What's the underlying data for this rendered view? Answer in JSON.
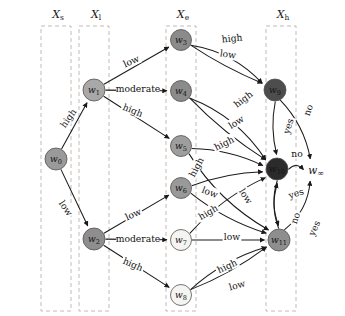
{
  "figure": {
    "width": 345,
    "height": 316,
    "background": "#ffffff",
    "type": "layered-directed-graph"
  },
  "groups": [
    {
      "id": "Xs",
      "label": "X",
      "subscript": "s",
      "label_x": 58,
      "label_y": 14,
      "box_x": 41,
      "box_y": 26,
      "box_w": 30,
      "box_h": 285
    },
    {
      "id": "Xl",
      "label": "X",
      "subscript": "l",
      "label_x": 96,
      "label_y": 14,
      "box_x": 79,
      "box_y": 26,
      "box_w": 30,
      "box_h": 285
    },
    {
      "id": "Xe",
      "label": "X",
      "subscript": "e",
      "label_x": 183,
      "label_y": 14,
      "box_x": 166,
      "box_y": 26,
      "box_w": 30,
      "box_h": 285
    },
    {
      "id": "Xh",
      "label": "X",
      "subscript": "h",
      "label_x": 283,
      "label_y": 14,
      "box_x": 266,
      "box_y": 26,
      "box_w": 30,
      "box_h": 285
    }
  ],
  "nodes": [
    {
      "id": "w0",
      "label": "w",
      "subscript": "0",
      "x": 56,
      "y": 159,
      "r": 11,
      "fill": "#9a9a9a",
      "text_tone": "on-dark"
    },
    {
      "id": "w1",
      "label": "w",
      "subscript": "1",
      "x": 94,
      "y": 90,
      "r": 11,
      "fill": "#a8a8a8",
      "text_tone": "on-dark"
    },
    {
      "id": "w2",
      "label": "w",
      "subscript": "2",
      "x": 94,
      "y": 239,
      "r": 11,
      "fill": "#8e8e8e",
      "text_tone": "on-dark"
    },
    {
      "id": "w3",
      "label": "w",
      "subscript": "3",
      "x": 181,
      "y": 40,
      "r": 10.5,
      "fill": "#8b8b8b",
      "text_tone": "on-dark"
    },
    {
      "id": "w4",
      "label": "w",
      "subscript": "4",
      "x": 181,
      "y": 91,
      "r": 10.5,
      "fill": "#8b8b8b",
      "text_tone": "on-dark"
    },
    {
      "id": "w5",
      "label": "w",
      "subscript": "5",
      "x": 181,
      "y": 146,
      "r": 10.5,
      "fill": "#9e9e9e",
      "text_tone": "on-dark"
    },
    {
      "id": "w6",
      "label": "w",
      "subscript": "6",
      "x": 181,
      "y": 188,
      "r": 10.5,
      "fill": "#999999",
      "text_tone": "on-dark"
    },
    {
      "id": "w7",
      "label": "w",
      "subscript": "7",
      "x": 181,
      "y": 240,
      "r": 10.5,
      "fill": "#f4f4f2",
      "text_tone": "on-light"
    },
    {
      "id": "w8",
      "label": "w",
      "subscript": "8",
      "x": 181,
      "y": 295,
      "r": 10.5,
      "fill": "#f4f4f2",
      "text_tone": "on-light"
    },
    {
      "id": "w9",
      "label": "w",
      "subscript": "9",
      "x": 275,
      "y": 90,
      "r": 11,
      "fill": "#4d4d4d",
      "text_tone": "on-dark"
    },
    {
      "id": "w10",
      "label": "w",
      "subscript": "10",
      "x": 277,
      "y": 169,
      "r": 11,
      "fill": "#2b2b2b",
      "text_tone": "on-dark"
    },
    {
      "id": "w11",
      "label": "w",
      "subscript": "11",
      "x": 279,
      "y": 240,
      "r": 11,
      "fill": "#8e8e8e",
      "text_tone": "on-dark"
    }
  ],
  "sink": {
    "id": "winf",
    "label": "w",
    "subscript": "∞",
    "x": 316,
    "y": 170
  },
  "edges": [
    {
      "id": "e-w0-w1",
      "from": "w0",
      "to": "w1",
      "label": "high",
      "label_x": 68,
      "label_y": 118,
      "rotate": -55,
      "curve": 0
    },
    {
      "id": "e-w0-w2",
      "from": "w0",
      "to": "w2",
      "label": "low",
      "label_x": 66,
      "label_y": 208,
      "rotate": 55,
      "curve": 0
    },
    {
      "id": "e-w1-w3",
      "from": "w1",
      "to": "w3",
      "label": "low",
      "label_x": 131,
      "label_y": 61,
      "rotate": -24,
      "curve": 0
    },
    {
      "id": "e-w1-w4",
      "from": "w1",
      "to": "w4",
      "label": "moderate",
      "label_x": 138,
      "label_y": 88,
      "rotate": 0,
      "curve": 0
    },
    {
      "id": "e-w1-w5",
      "from": "w1",
      "to": "w5",
      "label": "high",
      "label_x": 133,
      "label_y": 110,
      "rotate": 22,
      "curve": 0
    },
    {
      "id": "e-w2-w6",
      "from": "w2",
      "to": "w6",
      "label": "low",
      "label_x": 133,
      "label_y": 214,
      "rotate": -24,
      "curve": 0
    },
    {
      "id": "e-w2-w7",
      "from": "w2",
      "to": "w7",
      "label": "moderate",
      "label_x": 138,
      "label_y": 238,
      "rotate": 0,
      "curve": 0
    },
    {
      "id": "e-w2-w8",
      "from": "w2",
      "to": "w8",
      "label": "high",
      "label_x": 133,
      "label_y": 264,
      "rotate": 23,
      "curve": 0
    },
    {
      "id": "e-w3-w9-hi",
      "from": "w3",
      "to": "w9",
      "label": "high",
      "label_x": 232,
      "label_y": 38,
      "rotate": -6,
      "curve": -14
    },
    {
      "id": "e-w3-w9-lo",
      "from": "w3",
      "to": "w9",
      "label": "low",
      "label_x": 228,
      "label_y": 54,
      "rotate": 8,
      "curve": 4
    },
    {
      "id": "e-w4-w10-hi",
      "from": "w4",
      "to": "w10",
      "label": "high",
      "label_x": 243,
      "label_y": 99,
      "rotate": -38,
      "curve": -16
    },
    {
      "id": "e-w4-w10-lo",
      "from": "w4",
      "to": "w10",
      "label": "low",
      "label_x": 236,
      "label_y": 122,
      "rotate": -32,
      "curve": 6
    },
    {
      "id": "e-w5-w10",
      "from": "w5",
      "to": "w10",
      "label": "high",
      "label_x": 224,
      "label_y": 143,
      "rotate": -26,
      "curve": -8
    },
    {
      "id": "e-w5-w11",
      "from": "w5",
      "to": "w11",
      "label": "low",
      "label_x": 246,
      "label_y": 196,
      "rotate": 58,
      "curve": 14
    },
    {
      "id": "e-w6-w10",
      "from": "w6",
      "to": "w10",
      "label": "high",
      "label_x": 196,
      "label_y": 167,
      "rotate": -62,
      "curve": -6
    },
    {
      "id": "e-w6-w11",
      "from": "w6",
      "to": "w11",
      "label": "low",
      "label_x": 210,
      "label_y": 192,
      "rotate": 22,
      "curve": 8
    },
    {
      "id": "e-w7-w10",
      "from": "w7",
      "to": "w10",
      "label": "high",
      "label_x": 208,
      "label_y": 212,
      "rotate": -30,
      "curve": -10
    },
    {
      "id": "e-w7-w11",
      "from": "w7",
      "to": "w11",
      "label": "low",
      "label_x": 232,
      "label_y": 236,
      "rotate": 0,
      "curve": 0
    },
    {
      "id": "e-w8-w11-hi",
      "from": "w8",
      "to": "w11",
      "label": "high",
      "label_x": 227,
      "label_y": 266,
      "rotate": -25,
      "curve": -10
    },
    {
      "id": "e-w8-w11-lo",
      "from": "w8",
      "to": "w11",
      "label": "low",
      "label_x": 237,
      "label_y": 285,
      "rotate": -16,
      "curve": 6
    },
    {
      "id": "e-w9-inf",
      "from": "w9",
      "to": "winf",
      "label": "no",
      "label_x": 308,
      "label_y": 110,
      "rotate": -70,
      "curve": -10
    },
    {
      "id": "e-w9-w10",
      "from": "w9",
      "to": "w10",
      "label": "yes",
      "label_x": 288,
      "label_y": 126,
      "rotate": -72,
      "curve": 6
    },
    {
      "id": "e-w10-inf",
      "from": "w10",
      "to": "winf",
      "label": "no",
      "label_x": 297,
      "label_y": 153,
      "rotate": 0,
      "curve": -8
    },
    {
      "id": "e-w10-w11",
      "from": "w10",
      "to": "w11",
      "label": "yes",
      "label_x": 296,
      "label_y": 193,
      "rotate": -18,
      "curve": 8
    },
    {
      "id": "e-w11-w10",
      "from": "w11",
      "to": "w10",
      "label": "no",
      "label_x": 295,
      "label_y": 218,
      "rotate": -72,
      "curve": -8
    },
    {
      "id": "e-w11-inf",
      "from": "w11",
      "to": "winf",
      "label": "yes",
      "label_x": 314,
      "label_y": 228,
      "rotate": -66,
      "curve": 12
    }
  ]
}
